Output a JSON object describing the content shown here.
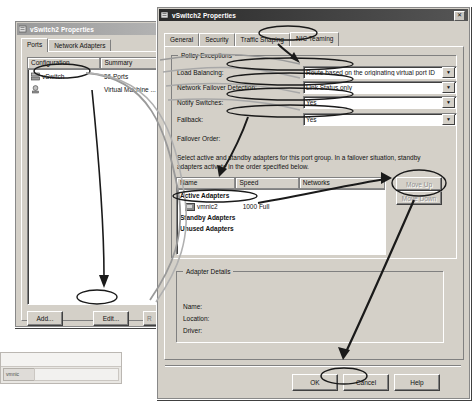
{
  "background_window": {
    "label": "vmnic"
  },
  "left_dialog": {
    "title": "vSwitch2 Properties",
    "title_icon": "vswitch-icon",
    "tabs": [
      {
        "label": "Ports",
        "selected": true
      },
      {
        "label": "Network Adapters",
        "selected": false
      }
    ],
    "list": {
      "columns": [
        "Configuration",
        "Summary"
      ],
      "rows": [
        {
          "icon": "vswitch-icon",
          "configuration": "vSwitch",
          "summary": "56 Ports"
        },
        {
          "icon": "portgroup-icon",
          "configuration": "",
          "summary": "Virtual Machine ..."
        }
      ]
    },
    "buttons": {
      "add": "Add...",
      "edit": "Edit...",
      "remove": "R"
    }
  },
  "right_dialog": {
    "title": "vSwitch2 Properties",
    "title_icon": "vswitch-icon",
    "close_label": "✕",
    "tabs": [
      {
        "label": "General",
        "selected": false
      },
      {
        "label": "Security",
        "selected": false
      },
      {
        "label": "Traffic Shaping",
        "selected": false
      },
      {
        "label": "NIC Teaming",
        "selected": true
      }
    ],
    "policy_exceptions": {
      "group_title": "Policy Exceptions",
      "fields": [
        {
          "label": "Load Balancing:",
          "value": "Route based on the originating virtual port ID"
        },
        {
          "label": "Network Failover Detection:",
          "value": "Link Status only"
        },
        {
          "label": "Notify Switches:",
          "value": "Yes"
        },
        {
          "label": "Failback:",
          "value": "Yes"
        }
      ],
      "failover_order_label": "Failover Order:",
      "instructions": "Select active and standby adapters for this port group.  In a failover situation, standby adapters activate  in the order specified below.",
      "adapter_table": {
        "columns": [
          "Name",
          "Speed",
          "Networks"
        ],
        "groups": [
          {
            "header": "Active Adapters",
            "rows": [
              {
                "icon": "nic-icon",
                "name": "vmnic2",
                "speed": "1000 Full",
                "networks": ""
              }
            ]
          },
          {
            "header": "Standby Adapters",
            "rows": []
          },
          {
            "header": "Unused Adapters",
            "rows": []
          }
        ]
      },
      "move_up_label": "Move Up",
      "move_down_label": "Move Down"
    },
    "adapter_details": {
      "group_title": "Adapter Details",
      "fields": [
        {
          "label": "Name:",
          "value": ""
        },
        {
          "label": "Location:",
          "value": ""
        },
        {
          "label": "Driver:",
          "value": ""
        }
      ]
    },
    "footer_buttons": {
      "ok": "OK",
      "cancel": "Cancel",
      "help": "Help"
    }
  },
  "annotation_colors": {
    "ink": "#1a1a1a",
    "ink_light": "#8f8f8f"
  }
}
